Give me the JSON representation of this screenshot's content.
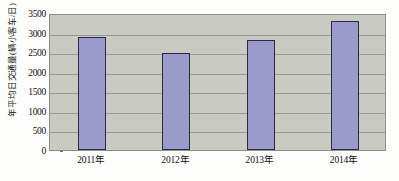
{
  "chart_data": {
    "type": "bar",
    "title": "",
    "xlabel": "",
    "ylabel": "年平均日交通量(辆小客车/日)",
    "categories": [
      "2011年",
      "2012年",
      "2013年",
      "2014年"
    ],
    "values": [
      2900,
      2490,
      2800,
      3300
    ],
    "ylim": [
      0,
      3500
    ],
    "ytick_labels": [
      "3500",
      "3000",
      "2500",
      "2000",
      "1500",
      "1000",
      "500",
      "0"
    ],
    "ytick_values": [
      3500,
      3000,
      2500,
      2000,
      1500,
      1000,
      500,
      0
    ],
    "grid": true,
    "legend": "none",
    "series": [
      {
        "name": "年平均日交通量",
        "values": [
          2900,
          2490,
          2800,
          3300
        ]
      }
    ],
    "colors": {
      "bar_fill": "#9a9acb",
      "bar_border": "#2b2b3d",
      "plot_background": "#c9cac2",
      "gridline": "#9a9b92",
      "axis_border": "#8d8e86",
      "canvas_background": "#fdfdfc",
      "text": "#111111"
    }
  }
}
